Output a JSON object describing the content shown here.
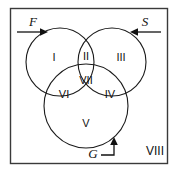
{
  "figure": {
    "type": "venn-diagram",
    "universe_label": "VIII",
    "background_color": "#ffffff",
    "line_color": "#111111",
    "frame_color": "#3a3a3a"
  },
  "sets": [
    {
      "id": "F",
      "label": "F",
      "arrow": "right",
      "position": "top-left"
    },
    {
      "id": "S",
      "label": "S",
      "arrow": "left",
      "position": "top-right"
    },
    {
      "id": "G",
      "label": "G",
      "arrow": "up",
      "position": "bottom-center"
    }
  ],
  "regions": [
    {
      "id": "r1",
      "label": "I",
      "meaning": "F only"
    },
    {
      "id": "r2",
      "label": "II",
      "meaning": "F and S"
    },
    {
      "id": "r3",
      "label": "III",
      "meaning": "S only"
    },
    {
      "id": "r4",
      "label": "IV",
      "meaning": "S and G"
    },
    {
      "id": "r5",
      "label": "V",
      "meaning": "G only"
    },
    {
      "id": "r6",
      "label": "VI",
      "meaning": "F and G"
    },
    {
      "id": "r7",
      "label": "VII",
      "meaning": "F and S and G"
    },
    {
      "id": "r8",
      "label": "VIII",
      "meaning": "outside all sets"
    }
  ],
  "labels": {
    "region_i": "I",
    "region_ii": "II",
    "region_iii": "III",
    "region_iv": "IV",
    "region_v": "V",
    "region_vi": "VI",
    "region_vii": "VII",
    "region_viii": "VIII",
    "set_f": "F",
    "set_s": "S",
    "set_g": "G"
  }
}
